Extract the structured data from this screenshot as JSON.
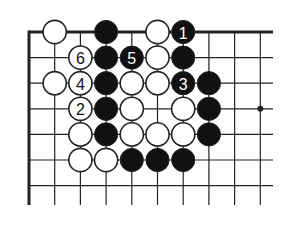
{
  "diagram": {
    "type": "go-board-fragment",
    "grid": {
      "columns": 10,
      "rows": 7,
      "origin_x": 29,
      "origin_y": 32,
      "spacing_x": 25.7,
      "spacing_y": 25.6,
      "line_extend_right": 273,
      "line_extend_bottom": 205,
      "top_edge": true,
      "left_edge": true
    },
    "star_points": [
      {
        "col": 9,
        "row": 3
      }
    ],
    "stones": [
      {
        "col": 1,
        "row": 0,
        "color": "white",
        "label": ""
      },
      {
        "col": 3,
        "row": 0,
        "color": "black",
        "label": ""
      },
      {
        "col": 5,
        "row": 0,
        "color": "white",
        "label": ""
      },
      {
        "col": 6,
        "row": 0,
        "color": "black",
        "label": "1"
      },
      {
        "col": 2,
        "row": 1,
        "color": "white",
        "label": "6"
      },
      {
        "col": 3,
        "row": 1,
        "color": "black",
        "label": ""
      },
      {
        "col": 4,
        "row": 1,
        "color": "black",
        "label": "5"
      },
      {
        "col": 5,
        "row": 1,
        "color": "white",
        "label": ""
      },
      {
        "col": 6,
        "row": 1,
        "color": "black",
        "label": ""
      },
      {
        "col": 1,
        "row": 2,
        "color": "white",
        "label": ""
      },
      {
        "col": 2,
        "row": 2,
        "color": "white",
        "label": "4"
      },
      {
        "col": 3,
        "row": 2,
        "color": "black",
        "label": ""
      },
      {
        "col": 4,
        "row": 2,
        "color": "white",
        "label": ""
      },
      {
        "col": 5,
        "row": 2,
        "color": "white",
        "label": ""
      },
      {
        "col": 6,
        "row": 2,
        "color": "black",
        "label": "3"
      },
      {
        "col": 7,
        "row": 2,
        "color": "black",
        "label": ""
      },
      {
        "col": 2,
        "row": 3,
        "color": "white",
        "label": "2"
      },
      {
        "col": 3,
        "row": 3,
        "color": "black",
        "label": ""
      },
      {
        "col": 4,
        "row": 3,
        "color": "white",
        "label": ""
      },
      {
        "col": 6,
        "row": 3,
        "color": "white",
        "label": ""
      },
      {
        "col": 7,
        "row": 3,
        "color": "black",
        "label": ""
      },
      {
        "col": 2,
        "row": 4,
        "color": "white",
        "label": ""
      },
      {
        "col": 3,
        "row": 4,
        "color": "black",
        "label": ""
      },
      {
        "col": 4,
        "row": 4,
        "color": "white",
        "label": ""
      },
      {
        "col": 5,
        "row": 4,
        "color": "white",
        "label": ""
      },
      {
        "col": 6,
        "row": 4,
        "color": "white",
        "label": ""
      },
      {
        "col": 7,
        "row": 4,
        "color": "black",
        "label": ""
      },
      {
        "col": 2,
        "row": 5,
        "color": "white",
        "label": ""
      },
      {
        "col": 3,
        "row": 5,
        "color": "white",
        "label": ""
      },
      {
        "col": 4,
        "row": 5,
        "color": "black",
        "label": ""
      },
      {
        "col": 5,
        "row": 5,
        "color": "black",
        "label": ""
      },
      {
        "col": 6,
        "row": 5,
        "color": "black",
        "label": ""
      }
    ],
    "colors": {
      "background": "#ffffff",
      "line": "#222222",
      "black_stone": "#111111",
      "white_stone": "#ffffff",
      "stone_outline": "#222222",
      "label_on_black": "#ffffff",
      "label_on_white": "#111111"
    }
  }
}
